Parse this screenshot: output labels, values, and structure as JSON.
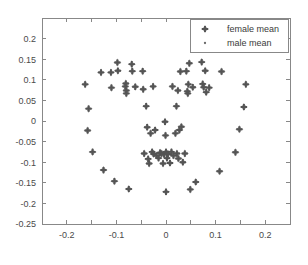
{
  "chart_data": {
    "type": "scatter",
    "title": "",
    "subtitle": "",
    "xlabel": "",
    "ylabel": "",
    "xlim": [
      -0.25,
      0.25
    ],
    "ylim": [
      -0.25,
      0.25
    ],
    "grid": false,
    "legend_position": "top-right",
    "xticks": [
      -0.2,
      -0.1,
      0,
      0.1,
      0.2
    ],
    "xtick_labels": [
      "-0.2",
      "-0.1",
      "0",
      "0.1",
      "0.2"
    ],
    "yticks": [
      0.2,
      0.15,
      0.1,
      0.05,
      0,
      -0.05,
      -0.1,
      -0.15,
      -0.2,
      -0.25
    ],
    "ytick_labels": [
      "0.2",
      "0.15",
      "0.1",
      "0.05",
      "0",
      "-0.05",
      "-0.1",
      "-0.15",
      "-0.2",
      "-0.25"
    ],
    "xminor_ticks": [
      -0.15,
      -0.05,
      0.05,
      0.15
    ],
    "series": [
      {
        "name": "female mean",
        "marker": "plus",
        "color": "#545454",
        "points": [
          [
            -0.163,
            0.089
          ],
          [
            -0.156,
            0.03
          ],
          [
            -0.158,
            -0.023
          ],
          [
            -0.148,
            -0.075
          ],
          [
            -0.131,
            0.118
          ],
          [
            -0.126,
            -0.119
          ],
          [
            -0.111,
            0.118
          ],
          [
            -0.11,
            0.081
          ],
          [
            -0.104,
            -0.146
          ],
          [
            -0.098,
            0.142
          ],
          [
            -0.097,
            0.122
          ],
          [
            -0.082,
            0.084
          ],
          [
            -0.081,
            0.091
          ],
          [
            -0.08,
            0.074
          ],
          [
            -0.08,
            0.067
          ],
          [
            -0.075,
            -0.165
          ],
          [
            -0.069,
            0.138
          ],
          [
            -0.068,
            0.121
          ],
          [
            -0.062,
            0.083
          ],
          [
            -0.047,
            0.121
          ],
          [
            -0.046,
            0.077
          ],
          [
            -0.044,
            -0.079
          ],
          [
            -0.04,
            0.036
          ],
          [
            -0.038,
            -0.015
          ],
          [
            -0.036,
            -0.092
          ],
          [
            -0.034,
            -0.103
          ],
          [
            -0.031,
            -0.03
          ],
          [
            -0.028,
            -0.075
          ],
          [
            -0.026,
            0.084
          ],
          [
            -0.025,
            -0.08
          ],
          [
            -0.022,
            -0.022
          ],
          [
            -0.019,
            -0.084
          ],
          [
            -0.015,
            -0.09
          ],
          [
            -0.012,
            -0.077
          ],
          [
            -0.009,
            -0.079
          ],
          [
            -0.006,
            -0.103
          ],
          [
            -0.004,
            -0.081
          ],
          [
            -0.002,
            -0.002
          ],
          [
            -0.001,
            -0.035
          ],
          [
            0.0,
            -0.172
          ],
          [
            0.0,
            -0.075
          ],
          [
            0.002,
            -0.09
          ],
          [
            0.004,
            -0.08
          ],
          [
            0.008,
            -0.102
          ],
          [
            0.011,
            -0.075
          ],
          [
            0.013,
            0.084
          ],
          [
            0.015,
            -0.084
          ],
          [
            0.019,
            -0.03
          ],
          [
            0.021,
            0.036
          ],
          [
            0.022,
            -0.079
          ],
          [
            0.024,
            0.074
          ],
          [
            0.025,
            -0.091
          ],
          [
            0.027,
            -0.022
          ],
          [
            0.029,
            0.12
          ],
          [
            0.031,
            -0.014
          ],
          [
            0.034,
            -0.1
          ],
          [
            0.038,
            -0.079
          ],
          [
            0.041,
            0.121
          ],
          [
            0.043,
            0.072
          ],
          [
            0.044,
            0.067
          ],
          [
            0.045,
            0.089
          ],
          [
            0.047,
            0.14
          ],
          [
            0.049,
            -0.166
          ],
          [
            0.054,
            0.082
          ],
          [
            0.06,
            -0.148
          ],
          [
            0.072,
            0.143
          ],
          [
            0.074,
            0.09
          ],
          [
            0.076,
            0.082
          ],
          [
            0.079,
            0.122
          ],
          [
            0.081,
            0.07
          ],
          [
            0.087,
            0.081
          ],
          [
            0.108,
            -0.122
          ],
          [
            0.112,
            0.12
          ],
          [
            0.14,
            -0.076
          ],
          [
            0.148,
            -0.02
          ],
          [
            0.157,
            0.034
          ],
          [
            0.161,
            0.089
          ]
        ]
      },
      {
        "name": "male mean",
        "marker": "dot",
        "color": "#6a6a6a",
        "points": []
      }
    ]
  },
  "legend": {
    "entries": [
      {
        "label": "female mean",
        "marker": "plus-marker-icon"
      },
      {
        "label": "male mean",
        "marker": "dot-marker-icon"
      }
    ]
  }
}
